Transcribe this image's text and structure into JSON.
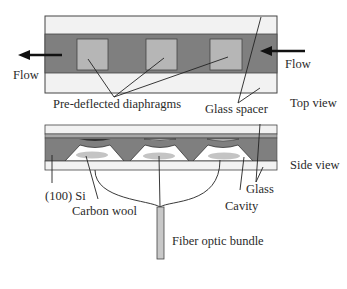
{
  "diagram": {
    "top_view": {
      "label": "Top view",
      "flow_left_label": "Flow",
      "flow_right_label": "Flow",
      "diaphragms_label": "Pre-deflected diaphragms",
      "spacer_label": "Glass spacer",
      "diaphragm_count": 3
    },
    "side_view": {
      "label": "Side view",
      "si_label": "(100) Si",
      "carbon_label": "Carbon wool",
      "glass_label": "Glass",
      "cavity_label": "Cavity",
      "fiber_label": "Fiber optic bundle"
    },
    "colors": {
      "dark_band": "#7d7d7d",
      "diaphragm": "#b4b4b4",
      "glass": "#f0f0f0",
      "outline": "#333333",
      "carbon": "#c4c4c4"
    }
  }
}
